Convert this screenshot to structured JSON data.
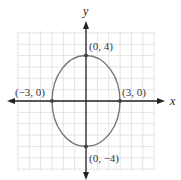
{
  "figure": {
    "type": "ellipse-on-grid",
    "equation_form": "x^2/9 + y^2/16 = 1",
    "axes": {
      "x_label": "x",
      "y_label": "y"
    },
    "grid": {
      "xmin": -6,
      "xmax": 6,
      "ymin": -6,
      "ymax": 6,
      "step": 1
    },
    "ellipse": {
      "center": [
        0,
        0
      ],
      "a": 3,
      "b": 4,
      "color": "#777777"
    },
    "points": [
      {
        "label": "(0, 4)",
        "x": 0,
        "y": 4
      },
      {
        "label": "(0, −4)",
        "x": 0,
        "y": -4
      },
      {
        "label": "(−3, 0)",
        "x": -3,
        "y": 0
      },
      {
        "label": "(3, 0)",
        "x": 3,
        "y": 0
      }
    ],
    "colors": {
      "grid": "#dddddd",
      "axis": "#222222",
      "curve": "#777777",
      "point": "#444444"
    }
  }
}
